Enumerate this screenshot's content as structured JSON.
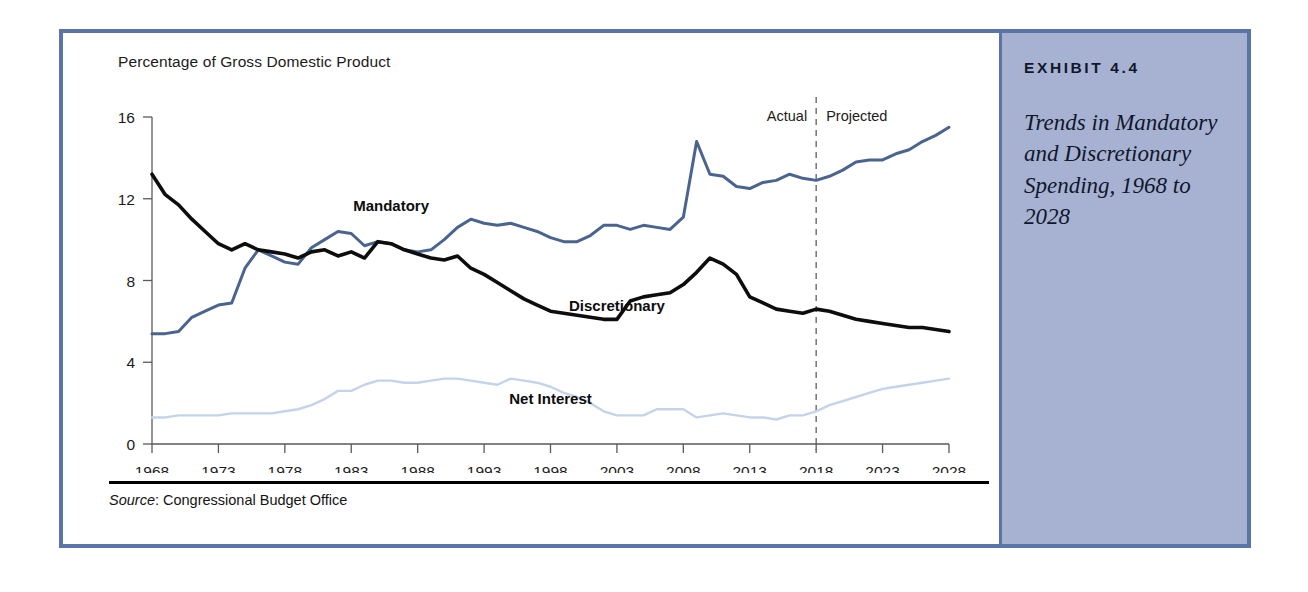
{
  "frame": {
    "border_color": "#5b74a8",
    "background": "#ffffff"
  },
  "caption": {
    "exhibit_number": "EXHIBIT 4.4",
    "title": "Trends in Mandatory and Discretionary Spending, 1968 to 2028",
    "background": "#a7b2d2"
  },
  "source": {
    "label": "Source",
    "separator": ": ",
    "text": "Congressional Budget Office"
  },
  "chart_data": {
    "type": "line",
    "title": "",
    "subtitle": "",
    "xlabel": "",
    "ylabel": "Percentage of Gross Domestic Product",
    "axis_note": "Percentage of Gross Domestic Product",
    "grid": false,
    "legend": "inline-labels",
    "xlim": [
      1968,
      2028
    ],
    "ylim": [
      0,
      16
    ],
    "yticks": [
      0,
      4,
      8,
      12,
      16
    ],
    "ytick_labels": [
      "0",
      "4",
      "8",
      "12",
      "16"
    ],
    "xticks": [
      1968,
      1973,
      1978,
      1983,
      1988,
      1993,
      1998,
      2003,
      2008,
      2013,
      2018,
      2023,
      2028
    ],
    "xtick_labels": [
      "1968",
      "1973",
      "1978",
      "1983",
      "1988",
      "1993",
      "1998",
      "2003",
      "2008",
      "2013",
      "2018",
      "2023",
      "2028"
    ],
    "x": [
      1968,
      1969,
      1970,
      1971,
      1972,
      1973,
      1974,
      1975,
      1976,
      1977,
      1978,
      1979,
      1980,
      1981,
      1982,
      1983,
      1984,
      1985,
      1986,
      1987,
      1988,
      1989,
      1990,
      1991,
      1992,
      1993,
      1994,
      1995,
      1996,
      1997,
      1998,
      1999,
      2000,
      2001,
      2002,
      2003,
      2004,
      2005,
      2006,
      2007,
      2008,
      2009,
      2010,
      2011,
      2012,
      2013,
      2014,
      2015,
      2016,
      2017,
      2018,
      2019,
      2020,
      2021,
      2022,
      2023,
      2024,
      2025,
      2026,
      2027,
      2028
    ],
    "divider": {
      "year": 2018,
      "left_label": "Actual",
      "right_label": "Projected",
      "style": "dashed"
    },
    "series": [
      {
        "name": "Mandatory",
        "color": "#4a6490",
        "label_x": 1986,
        "label_y": 11.4,
        "values": [
          5.4,
          5.4,
          5.5,
          6.2,
          6.5,
          6.8,
          6.9,
          8.6,
          9.5,
          9.2,
          8.9,
          8.8,
          9.6,
          10.0,
          10.4,
          10.3,
          9.7,
          9.9,
          9.8,
          9.5,
          9.4,
          9.5,
          10.0,
          10.6,
          11.0,
          10.8,
          10.7,
          10.8,
          10.6,
          10.4,
          10.1,
          9.9,
          9.9,
          10.2,
          10.7,
          10.7,
          10.5,
          10.7,
          10.6,
          10.5,
          11.1,
          14.8,
          13.2,
          13.1,
          12.6,
          12.5,
          12.8,
          12.9,
          13.2,
          13.0,
          12.9,
          13.1,
          13.4,
          13.8,
          13.9,
          13.9,
          14.2,
          14.4,
          14.8,
          15.1,
          15.5
        ]
      },
      {
        "name": "Discretionary",
        "color": "#0d0d0d",
        "label_x": 2003,
        "label_y": 6.5,
        "values": [
          13.2,
          12.2,
          11.7,
          11.0,
          10.4,
          9.8,
          9.5,
          9.8,
          9.5,
          9.4,
          9.3,
          9.1,
          9.4,
          9.5,
          9.2,
          9.4,
          9.1,
          9.9,
          9.8,
          9.5,
          9.3,
          9.1,
          9.0,
          9.2,
          8.6,
          8.3,
          7.9,
          7.5,
          7.1,
          6.8,
          6.5,
          6.4,
          6.3,
          6.2,
          6.1,
          6.1,
          7.0,
          7.2,
          7.3,
          7.4,
          7.8,
          8.4,
          9.1,
          8.8,
          8.3,
          7.2,
          6.9,
          6.6,
          6.5,
          6.4,
          6.6,
          6.5,
          6.3,
          6.1,
          6.0,
          5.9,
          5.8,
          5.7,
          5.7,
          5.6,
          5.5
        ]
      },
      {
        "name": "Net Interest",
        "color": "#c5d3ea",
        "label_x": 1998,
        "label_y": 1.95,
        "values": [
          1.3,
          1.3,
          1.4,
          1.4,
          1.4,
          1.4,
          1.5,
          1.5,
          1.5,
          1.5,
          1.6,
          1.7,
          1.9,
          2.2,
          2.6,
          2.6,
          2.9,
          3.1,
          3.1,
          3.0,
          3.0,
          3.1,
          3.2,
          3.2,
          3.1,
          3.0,
          2.9,
          3.2,
          3.1,
          3.0,
          2.8,
          2.5,
          2.3,
          2.0,
          1.6,
          1.4,
          1.4,
          1.4,
          1.7,
          1.7,
          1.7,
          1.3,
          1.4,
          1.5,
          1.4,
          1.3,
          1.3,
          1.2,
          1.4,
          1.4,
          1.6,
          1.9,
          2.1,
          2.3,
          2.5,
          2.7,
          2.8,
          2.9,
          3.0,
          3.1,
          3.2
        ]
      }
    ]
  }
}
